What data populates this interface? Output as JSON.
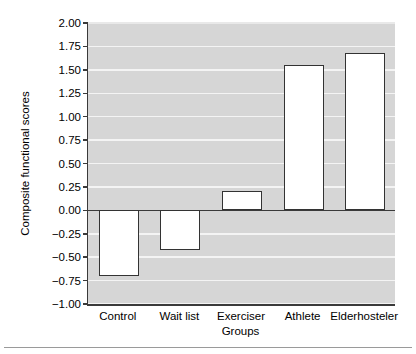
{
  "chart_data": {
    "type": "bar",
    "title": "",
    "subtitle": "",
    "xlabel": "Groups",
    "ylabel": "Composite functional scores",
    "categories": [
      "Control",
      "Wait list",
      "Exerciser",
      "Athlete",
      "Elderhosteler"
    ],
    "values": [
      -0.7,
      -0.42,
      0.21,
      1.55,
      1.68
    ],
    "series": [
      {
        "name": "Composite functional scores",
        "values": [
          -0.7,
          -0.42,
          0.21,
          1.55,
          1.68
        ]
      }
    ],
    "ylim": [
      -1.0,
      2.0
    ],
    "ytick_values": [
      2.0,
      1.75,
      1.5,
      1.25,
      1.0,
      0.75,
      0.5,
      0.25,
      0.0,
      -0.25,
      -0.5,
      -0.75,
      -1.0
    ],
    "ytick_labels": [
      "2.00",
      "1.75",
      "1.50",
      "1.25",
      "1.00",
      "0.75",
      "0.50",
      "0.25",
      "0.00",
      "−0.25",
      "−0.50",
      "−0.75",
      "−1.00"
    ],
    "ytick_step": 0.25,
    "grid": true,
    "grid_axis": "y",
    "legend": false,
    "legend_position": "none",
    "zero_line": 0.0,
    "bar_fill_color": "#ffffff",
    "bar_edge_color": "#333333",
    "plot_background_color": "#d6d6d6",
    "gridline_color": "#f4f4f4",
    "axis_color": "#3a3a3a",
    "figure_background_color": "#ffffff"
  }
}
